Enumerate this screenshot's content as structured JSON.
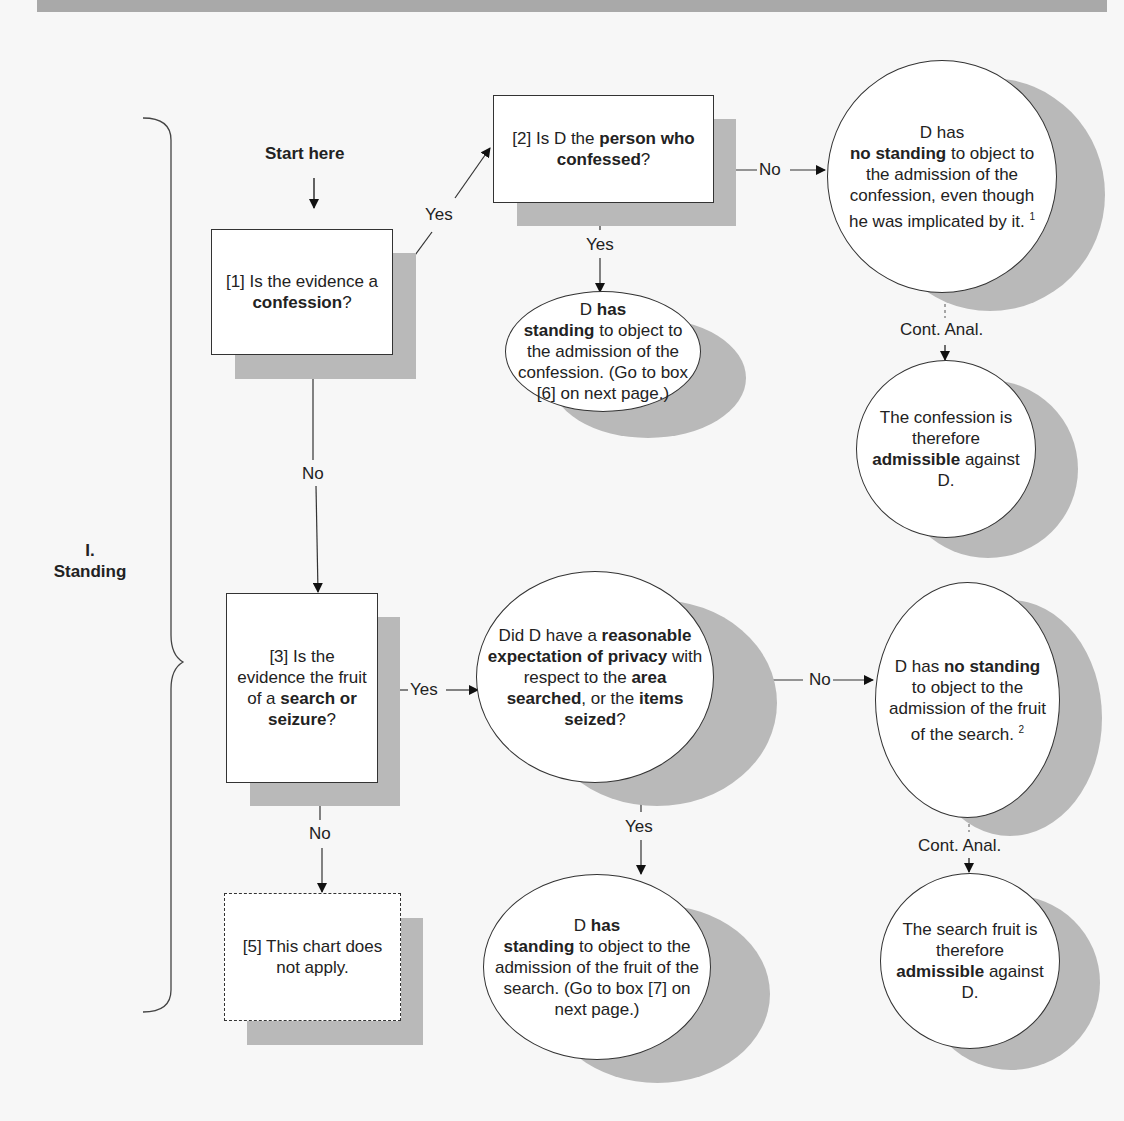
{
  "section": {
    "number": "I.",
    "title": "Standing"
  },
  "start_label": "Start here",
  "edge_labels": {
    "yes": "Yes",
    "no": "No",
    "cont_anal": "Cont. Anal."
  },
  "nodes": {
    "box1": {
      "pre": "[1] Is the evidence a ",
      "bold": "confession",
      "post": "?"
    },
    "box2": {
      "pre": "[2] Is D the ",
      "bold": "person who confessed",
      "post": "?"
    },
    "box3": {
      "pre": "[3] Is the evidence the fruit of a ",
      "bold": "search or seizure",
      "post": "?"
    },
    "box5": {
      "text": "[5] This chart does not apply."
    },
    "no_standing_confession": {
      "pre": "D has ",
      "bold": "no standing",
      "post": " to object to the admission of the confession, even though he was implicated by it. ",
      "footnote": "1"
    },
    "has_standing_confession": {
      "pre": "D ",
      "bold1": "has",
      "bold2": "standing",
      "post": " to object to the admission of the confession. (Go to box [6] on next page.)"
    },
    "confession_admissible": {
      "pre": "The confession is therefore ",
      "bold": "admissible",
      "post": " against D."
    },
    "privacy_question": {
      "t1": "Did D have a ",
      "b1": "reasonable expectation of privacy",
      "t2": " with respect to the ",
      "b2": "area searched",
      "t3": ", or the ",
      "b3": "items seized",
      "t4": "?"
    },
    "no_standing_search": {
      "pre": "D has ",
      "bold": "no standing",
      "post": " to object to the admission of the fruit of the search. ",
      "footnote": "2"
    },
    "has_standing_search": {
      "pre": "D ",
      "bold1": "has",
      "bold2": "standing",
      "post": " to object to the admission of the fruit of the search. (Go to box [7] on next page.)"
    },
    "search_admissible": {
      "pre": "The search fruit is therefore ",
      "bold": "admissible",
      "post": " against D."
    }
  }
}
